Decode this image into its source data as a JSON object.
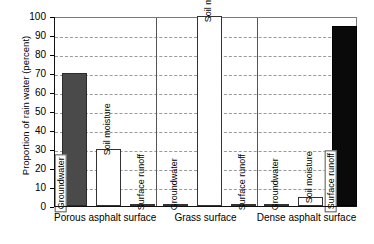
{
  "chart_data": {
    "type": "bar",
    "title": "",
    "xlabel": "",
    "ylabel": "Proportion of rain water (percent)",
    "ylim": [
      0,
      100
    ],
    "ytick_step": 10,
    "yticks": [
      0,
      10,
      20,
      30,
      40,
      50,
      60,
      70,
      80,
      90,
      100
    ],
    "grid": true,
    "legend": "none",
    "categories": [
      "Porous asphalt surface",
      "Grass surface",
      "Dense asphalt surface"
    ],
    "series": [
      {
        "name": "Groundwater",
        "values": [
          70,
          0,
          0
        ]
      },
      {
        "name": "Soil moisture",
        "values": [
          30,
          100,
          5
        ]
      },
      {
        "name": "Surface runoff",
        "values": [
          0,
          0,
          95
        ]
      }
    ],
    "bars": [
      {
        "group": "Porous asphalt surface",
        "label": "Groundwater",
        "value": 70,
        "fill": "dark",
        "label_inside": true
      },
      {
        "group": "Porous asphalt surface",
        "label": "Soil moisture",
        "value": 30,
        "fill": "white",
        "label_inside": false
      },
      {
        "group": "Porous asphalt surface",
        "label": "Surface runoff",
        "value": 0,
        "fill": "white",
        "label_inside": false
      },
      {
        "group": "Grass surface",
        "label": "Groundwater",
        "value": 0,
        "fill": "white",
        "label_inside": false
      },
      {
        "group": "Grass surface",
        "label": "Soil moisture",
        "value": 100,
        "fill": "white",
        "label_inside": false
      },
      {
        "group": "Grass surface",
        "label": "Surface runoff",
        "value": 0,
        "fill": "white",
        "label_inside": false
      },
      {
        "group": "Dense asphalt surface",
        "label": "Groundwater",
        "value": 0,
        "fill": "white",
        "label_inside": false
      },
      {
        "group": "Dense asphalt surface",
        "label": "Soil moisture",
        "value": 5,
        "fill": "white",
        "label_inside": false
      },
      {
        "group": "Dense asphalt surface",
        "label": "Surface runoff",
        "value": 95,
        "fill": "black",
        "label_inside": true
      }
    ],
    "colors": {
      "groundwater_porous": "#4a4a4a",
      "surface_runoff_dense": "#0a0a0a",
      "bar_white": "#ffffff",
      "axis": "#111111",
      "grid": "#9a9a9a"
    }
  }
}
